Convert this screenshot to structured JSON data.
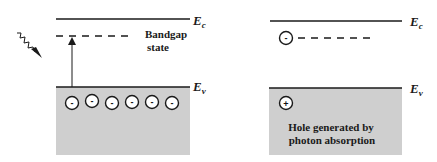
{
  "colors": {
    "band_fill": "#cfcfcf",
    "line": "#1a1a1a",
    "background": "#ffffff"
  },
  "left_panel": {
    "conduction_band": {
      "label": "E",
      "subscript": "c"
    },
    "valence_band": {
      "label": "E",
      "subscript": "v"
    },
    "bandgap_state_label_line1": "Bandgap",
    "bandgap_state_label_line2": "state",
    "photon_icon": "zigzag-photon-arrow",
    "excitation_arrow": "upward-arrow",
    "electrons": [
      {
        "symbol": "-"
      },
      {
        "symbol": "-"
      },
      {
        "symbol": "-"
      },
      {
        "symbol": "-"
      },
      {
        "symbol": "-"
      },
      {
        "symbol": "-"
      }
    ]
  },
  "right_panel": {
    "conduction_band": {
      "label": "E",
      "subscript": "c"
    },
    "valence_band": {
      "label": "E",
      "subscript": "v"
    },
    "trapped_electron": {
      "symbol": "-"
    },
    "hole": {
      "symbol": "+"
    },
    "hole_caption_line1": "Hole generated by",
    "hole_caption_line2": "photon absorption"
  }
}
